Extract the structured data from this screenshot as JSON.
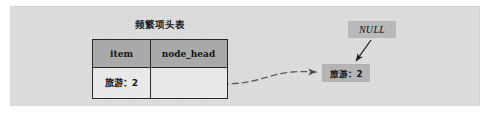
{
  "diagram": {
    "title": "频繁项头表",
    "table": {
      "columns": [
        "item",
        "node_head"
      ],
      "rows": [
        {
          "item": "旅游：2",
          "node_head": ""
        }
      ]
    },
    "tree_node": {
      "label": "旅游：2"
    },
    "null_label": {
      "text": "NULL"
    },
    "connectors": [
      {
        "name": "node-head-to-tree-node",
        "style": "dashed",
        "arrow": "end"
      },
      {
        "name": "null-to-tree-node",
        "style": "solid",
        "arrow": "end"
      }
    ],
    "colors": {
      "panel_background": "#dcdcdc",
      "header_fill": "#a9a9a9",
      "cell_fill": "#e9e9e9",
      "node_fill": "#b4b4b4",
      "null_fill": "#b9b9b9",
      "border": "#2a2a2a",
      "connector": "#5a5a5a"
    }
  }
}
